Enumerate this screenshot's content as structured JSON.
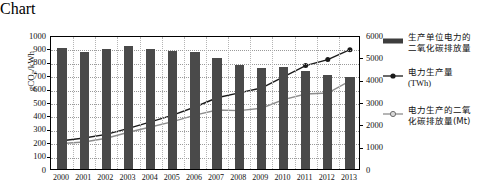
{
  "chart_data": {
    "type": "bar",
    "title": "",
    "xlabel": "年份",
    "ylabel": "gCO2/kWh",
    "ylabel_left": "gCO₂/kWh",
    "ylim": [
      0,
      1000
    ],
    "ylim_right": [
      0,
      6000
    ],
    "grid": true,
    "legend_position": "right",
    "categories": [
      "2000",
      "2001",
      "2002",
      "2003",
      "2004",
      "2005",
      "2006",
      "2007",
      "2008",
      "2009",
      "2010",
      "2011",
      "2012",
      "2013"
    ],
    "series": [
      {
        "name": "生产单位电力的二氧化碳排放量",
        "type": "bar",
        "axis": "left",
        "unit": "gCO₂/kWh",
        "color": "#4a4a4a",
        "values": [
          900,
          875,
          895,
          915,
          895,
          880,
          875,
          830,
          775,
          755,
          760,
          730,
          700,
          690
        ]
      },
      {
        "name": "电力生产量 (TWh)",
        "type": "line",
        "axis": "right",
        "unit": "TWh",
        "marker": "filled-circle",
        "color": "#1a1a1a",
        "values": [
          1355,
          1480,
          1640,
          1910,
          2200,
          2500,
          2865,
          3280,
          3495,
          3715,
          4210,
          4720,
          4990,
          5430
        ]
      },
      {
        "name": "电力生产的二氧化碳排放量(Mt)",
        "type": "line",
        "axis": "right",
        "unit": "Mt",
        "marker": "open-circle",
        "color": "#8d8d8d",
        "values": [
          1230,
          1300,
          1465,
          1735,
          1970,
          2210,
          2500,
          2730,
          2705,
          2810,
          3195,
          3450,
          3490,
          4040
        ]
      }
    ],
    "yticks_left": [
      "0",
      "100",
      "200",
      "300",
      "400",
      "500",
      "600",
      "700",
      "800",
      "900",
      "1000"
    ],
    "yticks_right": [
      "0",
      "1000",
      "2000",
      "3000",
      "4000",
      "5000",
      "6000"
    ]
  },
  "legend": {
    "items": [
      {
        "marker": "bar-swatch",
        "line1": "生产单位电力的",
        "line2": "二氧化碳排放量"
      },
      {
        "marker": "line-filled",
        "line1": "电力生产量",
        "line2": "(TWh)"
      },
      {
        "marker": "line-open",
        "line1": "电力生产的二氧",
        "line2": "化碳排放量(Mt)"
      }
    ]
  },
  "axes": {
    "x_title": "年份",
    "y_left_title": "gCO",
    "y_left_sub": "2",
    "y_left_rest": "/kWh"
  }
}
